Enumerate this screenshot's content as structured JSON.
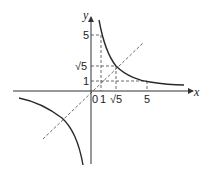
{
  "diagram": {
    "title": "",
    "axes": {
      "x_label": "x",
      "y_label": "y",
      "origin_label": "0"
    },
    "x_ticks": [
      {
        "value": 1,
        "label": "1"
      },
      {
        "value": 2.236,
        "label": "√5"
      },
      {
        "value": 5,
        "label": "5"
      }
    ],
    "y_ticks": [
      {
        "value": 1,
        "label": "1"
      },
      {
        "value": 2.236,
        "label": "√5"
      },
      {
        "value": 5,
        "label": "5"
      }
    ],
    "curves": [
      {
        "name": "hyperbola",
        "equation": "y = 5/x",
        "style": "solid"
      },
      {
        "name": "line",
        "equation": "y = x",
        "style": "dashed"
      }
    ],
    "key_points": [
      {
        "x": 1,
        "y": 5
      },
      {
        "x": 2.236,
        "y": 2.236
      },
      {
        "x": 5,
        "y": 1
      }
    ],
    "colors": {
      "ink": "#222222",
      "background": "#ffffff"
    }
  }
}
